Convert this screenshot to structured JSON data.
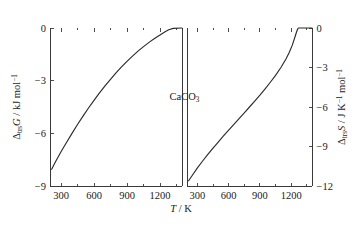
{
  "figure": {
    "annotation": "CaCO3",
    "annotation_parts": {
      "base": "CaCO",
      "sub": "3"
    },
    "xlabel_parts": {
      "symbol": "T",
      "unit": "/ K"
    }
  },
  "chart_data": {
    "type": "line",
    "title": "",
    "subtitle": "",
    "annotations": [
      "CaCO3"
    ],
    "grid": false,
    "legend": "none",
    "shared_x": {
      "label": "T / K",
      "symbol": "T",
      "unit": "K",
      "range": [
        200,
        1400
      ],
      "ticks": [
        300,
        600,
        900,
        1200
      ],
      "ticklabels": [
        "300",
        "600",
        "900",
        "1200"
      ],
      "minor_ticks": [
        450,
        750,
        1050,
        1350
      ]
    },
    "panels": [
      {
        "name": "left-panel",
        "ylabel": "ΔtrsG / kJ mol^-1",
        "ylabel_parts": {
          "delta": "Δ",
          "sub": "trs",
          "symbol": "G",
          "unit_sep": "/ kJ mol",
          "unit_sup": "−1"
        },
        "ylim": [
          -9,
          0
        ],
        "yticks": [
          0,
          -3,
          -6,
          -9
        ],
        "yticklabels": [
          "0",
          "−3",
          "−6",
          "−9"
        ],
        "series": [
          {
            "name": "ΔtrsG",
            "x": [
              215,
              250,
              300,
              350,
              400,
              450,
              500,
              550,
              600,
              650,
              700,
              750,
              800,
              850,
              900,
              950,
              1000,
              1050,
              1100,
              1150,
              1200,
              1250,
              1280,
              1320,
              1400
            ],
            "y": [
              -8.05,
              -7.62,
              -7.05,
              -6.52,
              -6.0,
              -5.5,
              -5.02,
              -4.56,
              -4.12,
              -3.7,
              -3.3,
              -2.92,
              -2.56,
              -2.22,
              -1.9,
              -1.6,
              -1.32,
              -1.06,
              -0.82,
              -0.6,
              -0.4,
              -0.2,
              -0.1,
              -0.02,
              0.0
            ]
          }
        ]
      },
      {
        "name": "right-panel",
        "ylabel": "ΔtrsS / J K^-1 mol^-1",
        "ylabel_parts": {
          "delta": "Δ",
          "sub": "trs",
          "symbol": "S",
          "unit_sep": "/ J K",
          "unit_sup1": "−1",
          "unit_mid": " mol",
          "unit_sup2": "−1"
        },
        "ylim": [
          -12,
          0
        ],
        "yticks": [
          0,
          -3,
          -6,
          -9,
          -12
        ],
        "yticklabels": [
          "0",
          "−3",
          "−6",
          "−9",
          "−12"
        ],
        "series": [
          {
            "name": "ΔtrsS",
            "x": [
              215,
              250,
              300,
              350,
              400,
              450,
              500,
              550,
              600,
              650,
              700,
              750,
              800,
              850,
              900,
              950,
              1000,
              1050,
              1100,
              1150,
              1180,
              1210,
              1235,
              1250,
              1262,
              1270,
              1400
            ],
            "y": [
              -11.6,
              -11.2,
              -10.62,
              -10.1,
              -9.6,
              -9.12,
              -8.66,
              -8.2,
              -7.76,
              -7.32,
              -6.88,
              -6.45,
              -6.0,
              -5.55,
              -5.1,
              -4.62,
              -4.12,
              -3.6,
              -3.02,
              -2.35,
              -1.88,
              -1.32,
              -0.72,
              -0.34,
              -0.08,
              0.0,
              0.0
            ]
          }
        ]
      }
    ]
  }
}
